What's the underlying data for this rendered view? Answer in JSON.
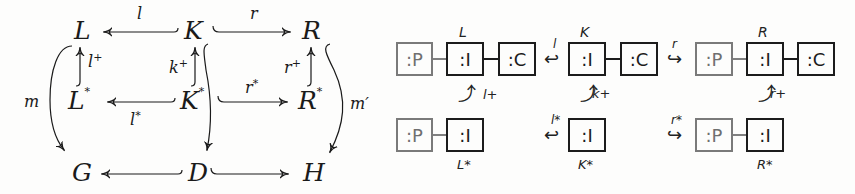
{
  "left_diagram": {
    "nodes": {
      "L": "L",
      "K": "K",
      "R": "R",
      "L_star": "L",
      "K_star": "K",
      "R_star": "R",
      "G": "G",
      "D": "D",
      "H": "H",
      "star": "*"
    },
    "arrow_labels": {
      "l": "l",
      "r": "r",
      "l_plus": "l",
      "k_plus": "k",
      "r_plus": "r",
      "plus": "+",
      "l_star": "l",
      "r_star": "r",
      "star": "*",
      "m": "m",
      "m_prime": "m′"
    }
  },
  "right_diagram": {
    "row1": {
      "L": {
        "label": "L",
        "boxes": [
          ":P",
          ":I",
          ":C"
        ]
      },
      "K": {
        "label": "K",
        "boxes": [
          ":I",
          ":C"
        ]
      },
      "R": {
        "label": "R",
        "boxes": [
          ":P",
          ":I",
          ":C"
        ]
      }
    },
    "row2": {
      "L_star": {
        "label": "L*",
        "boxes": [
          ":P",
          ":I"
        ]
      },
      "K_star": {
        "label": "K*",
        "boxes": [
          ":I"
        ]
      },
      "R_star": {
        "label": "R*",
        "boxes": [
          ":P",
          ":I"
        ]
      }
    },
    "arrows": {
      "l": "l",
      "r": "r",
      "l_star": "l*",
      "r_star": "r*",
      "l_plus": "l+",
      "k_plus": "k+",
      "r_plus": "r+",
      "hook_left": "↩",
      "hook_right": "↪",
      "hook_up": "⤴"
    }
  }
}
